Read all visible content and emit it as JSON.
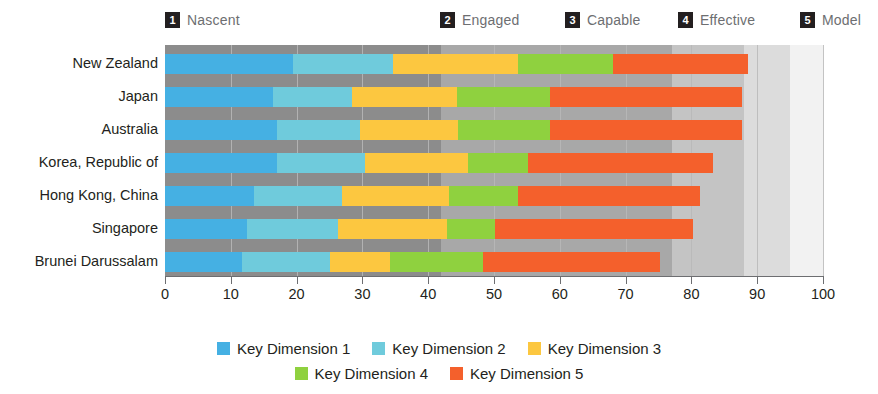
{
  "stages": [
    {
      "num": "1",
      "label": "Nascent",
      "left_px": 165
    },
    {
      "num": "2",
      "label": "Engaged",
      "left_px": 440
    },
    {
      "num": "3",
      "label": "Capable",
      "left_px": 565
    },
    {
      "num": "4",
      "label": "Effective",
      "left_px": 678
    },
    {
      "num": "5",
      "label": "Model",
      "left_px": 800
    }
  ],
  "colors": {
    "dim1": "#45b0e3",
    "dim2": "#6fcbdc",
    "dim3": "#fcc740",
    "dim4": "#8fd13f",
    "dim5": "#f4602c",
    "zone1": "#8c8c8c",
    "zone2": "#a8a8a8",
    "zone3": "#c4c4c4",
    "zone4": "#dcdcdc",
    "zone5": "#f2f2f2",
    "axis": "#6d6e71",
    "text": "#231f20",
    "stage_label": "#6d6e71"
  },
  "legend": {
    "row1": [
      {
        "label": "Key Dimension 1",
        "color": "#45b0e3"
      },
      {
        "label": "Key Dimension 2",
        "color": "#6fcbdc"
      },
      {
        "label": "Key Dimension 3",
        "color": "#fcc740"
      }
    ],
    "row2": [
      {
        "label": "Key Dimension 4",
        "color": "#8fd13f"
      },
      {
        "label": "Key Dimension 5",
        "color": "#f4602c"
      }
    ]
  },
  "chart_data": {
    "type": "bar",
    "orientation": "horizontal",
    "stacked": true,
    "title": "",
    "xlabel": "",
    "ylabel": "",
    "xlim": [
      0,
      100
    ],
    "xticks": [
      0,
      10,
      20,
      30,
      40,
      50,
      60,
      70,
      80,
      90,
      100
    ],
    "grid": false,
    "legend_position": "bottom",
    "categories": [
      "New Zealand",
      "Japan",
      "Australia",
      "Korea, Republic of",
      "Hong Kong, China",
      "Singapore",
      "Brunei Darussalam"
    ],
    "series": [
      {
        "name": "Key Dimension 1",
        "color": "#45b0e3",
        "values": [
          19.5,
          16.4,
          17.0,
          17.0,
          13.5,
          12.5,
          11.7
        ]
      },
      {
        "name": "Key Dimension 2",
        "color": "#6fcbdc",
        "values": [
          15.2,
          12.0,
          12.6,
          13.4,
          13.4,
          13.8,
          13.4
        ]
      },
      {
        "name": "Key Dimension 3",
        "color": "#fcc740",
        "values": [
          18.9,
          16.0,
          14.9,
          15.6,
          16.3,
          16.6,
          9.1
        ]
      },
      {
        "name": "Key Dimension 4",
        "color": "#8fd13f",
        "values": [
          14.5,
          14.1,
          14.0,
          9.2,
          10.4,
          7.3,
          14.1
        ]
      },
      {
        "name": "Key Dimension 5",
        "color": "#f4602c",
        "values": [
          20.5,
          29.2,
          29.2,
          28.1,
          27.7,
          30.0,
          26.9
        ]
      }
    ],
    "totals": [
      88.6,
      87.7,
      87.7,
      83.3,
      81.3,
      80.2,
      75.2
    ],
    "stage_bands": [
      {
        "num": "1",
        "label": "Nascent",
        "range": [
          0,
          42
        ],
        "color": "#8c8c8c"
      },
      {
        "num": "2",
        "label": "Engaged",
        "range": [
          42,
          77
        ],
        "color": "#a8a8a8"
      },
      {
        "num": "3",
        "label": "Capable",
        "range": [
          77,
          88
        ],
        "color": "#c4c4c4"
      },
      {
        "num": "4",
        "label": "Effective",
        "range": [
          88,
          95
        ],
        "color": "#dcdcdc"
      },
      {
        "num": "5",
        "label": "Model",
        "range": [
          95,
          100
        ],
        "color": "#f2f2f2"
      }
    ]
  }
}
